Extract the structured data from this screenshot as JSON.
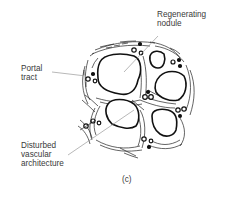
{
  "figure": {
    "panel_label": "(c)",
    "labels": {
      "regenerating_nodule": [
        "Regenerating",
        "nodule"
      ],
      "portal_tract": [
        "Portal",
        "tract"
      ],
      "disturbed_vascular": [
        "Disturbed",
        "vascular",
        "architecture"
      ]
    },
    "colors": {
      "ink": "#111111",
      "text": "#3a3a3a",
      "leader": "#888888",
      "background": "#ffffff"
    }
  }
}
